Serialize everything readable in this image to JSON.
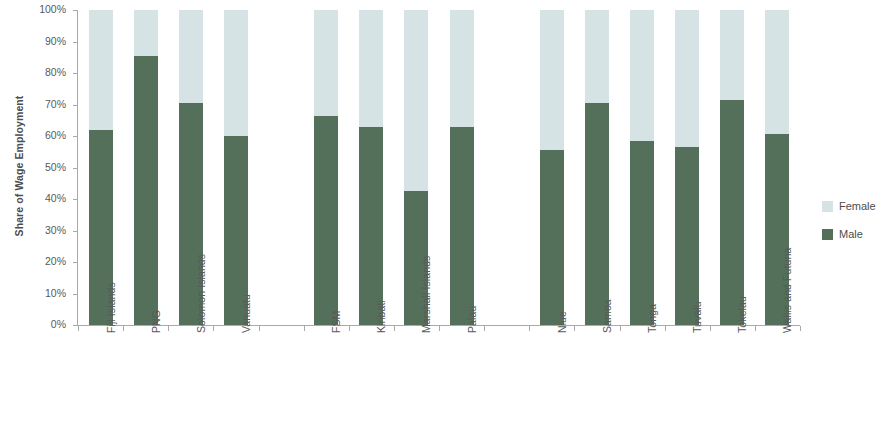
{
  "chart_data": {
    "type": "bar",
    "subtype": "stacked-100-percent",
    "title": "",
    "xlabel": "",
    "ylabel": "Share of Wage Employment",
    "ylim": [
      0,
      100
    ],
    "ytick_labels": [
      "100%",
      "90%",
      "80%",
      "70%",
      "60%",
      "50%",
      "40%",
      "30%",
      "20%",
      "10%",
      "0%"
    ],
    "ytick_values": [
      100,
      90,
      80,
      70,
      60,
      50,
      40,
      30,
      20,
      10,
      0
    ],
    "grid": false,
    "legend_position": "right",
    "categories": [
      "Fiji Islands",
      "PNG",
      "Solomon Islands",
      "Vanuatu",
      "",
      "FSM",
      "Kiribati",
      "Marshall Islands",
      "Palau",
      "",
      "Niue",
      "Samoa",
      "Tonga",
      "Tuvalu",
      "Tokelau",
      "Wallis and Futuna"
    ],
    "series": [
      {
        "name": "Male",
        "color": "#54705a",
        "values": [
          62,
          85.5,
          70.5,
          60,
          null,
          66.5,
          63,
          42.5,
          63,
          null,
          55.5,
          70.5,
          58.5,
          56.5,
          71.5,
          60.5
        ]
      },
      {
        "name": "Female",
        "color": "#d6e3e5",
        "values": [
          38,
          14.5,
          29.5,
          40,
          null,
          33.5,
          37,
          57.5,
          37,
          null,
          44.5,
          29.5,
          41.5,
          43.5,
          28.5,
          39.5
        ]
      }
    ]
  },
  "legend": {
    "items": [
      {
        "label": "Female",
        "color": "#d6e3e5"
      },
      {
        "label": "Male",
        "color": "#54705a"
      }
    ]
  },
  "axis": {
    "y_title": "Share of Wage Employment"
  }
}
